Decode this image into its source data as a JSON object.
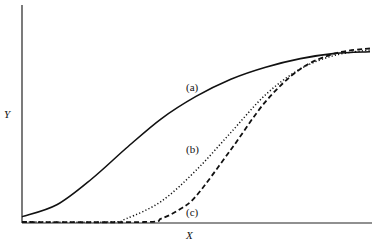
{
  "chart_data": {
    "type": "line",
    "title": "",
    "xlabel": "X",
    "ylabel": "Y",
    "grid": false,
    "legend": "none (curves labeled inline)",
    "xlim": [
      0,
      1
    ],
    "ylim": [
      0,
      1
    ],
    "series": [
      {
        "name": "(a)",
        "style": "solid",
        "x": [
          0.0,
          0.1,
          0.2,
          0.3,
          0.4,
          0.5,
          0.6,
          0.7,
          0.8,
          0.9,
          1.0
        ],
        "y": [
          0.03,
          0.1,
          0.25,
          0.43,
          0.6,
          0.73,
          0.83,
          0.9,
          0.95,
          0.98,
          0.99
        ]
      },
      {
        "name": "(b)",
        "style": "dotted",
        "x": [
          0.0,
          0.25,
          0.3,
          0.4,
          0.5,
          0.6,
          0.7,
          0.8,
          0.9,
          1.0
        ],
        "y": [
          0.0,
          0.0,
          0.02,
          0.12,
          0.3,
          0.52,
          0.74,
          0.89,
          0.97,
          1.0
        ]
      },
      {
        "name": "(c)",
        "style": "dashed",
        "x": [
          0.0,
          0.35,
          0.4,
          0.45,
          0.5,
          0.6,
          0.7,
          0.8,
          0.9,
          1.0
        ],
        "y": [
          0.0,
          0.0,
          0.02,
          0.07,
          0.15,
          0.42,
          0.7,
          0.89,
          0.98,
          1.01
        ]
      }
    ],
    "annotations": [
      "(a)",
      "(b)",
      "(c)"
    ]
  },
  "labels": {
    "y_axis": "Y",
    "x_axis": "X",
    "curve_a": "(a)",
    "curve_b": "(b)",
    "curve_c": "(c)"
  }
}
